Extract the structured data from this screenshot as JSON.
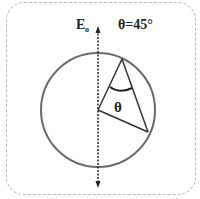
{
  "diagram": {
    "field_label": "E",
    "field_subscript": "o",
    "angle_label": "θ=45°",
    "angle_symbol": "θ",
    "colors": {
      "circle": "#6a6a6a",
      "lines": "#333333",
      "axis": "#222222",
      "frame": "#b8b8b8"
    }
  }
}
